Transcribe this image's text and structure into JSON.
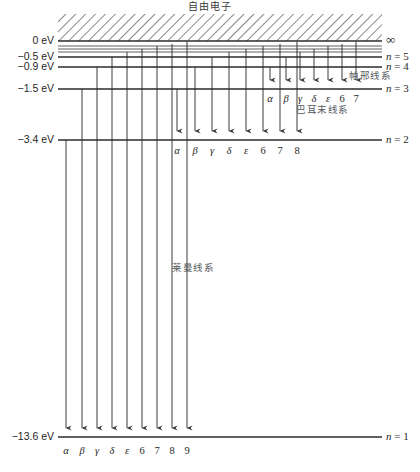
{
  "figure": {
    "top_title": "自由电子",
    "infinity_label": "∞",
    "background": "#ffffff",
    "line_color": "#2b2b2b",
    "arrow_color": "#3a3a3a",
    "annotation_color": "#555a5e"
  },
  "levels": [
    {
      "n": "",
      "energy_label": "0 eV",
      "right_label_prefix": "",
      "right_label": "",
      "y": 41,
      "is_continuum_edge": true
    },
    {
      "n": "5",
      "energy_label": "−0.5 eV",
      "right_label_prefix": "n",
      "right_label": "= 5",
      "y": 57,
      "is_continuum_edge": false
    },
    {
      "n": "4",
      "energy_label": "−0.9 eV",
      "right_label_prefix": "n",
      "right_label": "= 4",
      "y": 67,
      "is_continuum_edge": false
    },
    {
      "n": "3",
      "energy_label": "−1.5 eV",
      "right_label_prefix": "n",
      "right_label": "= 3",
      "y": 89,
      "is_continuum_edge": false
    },
    {
      "n": "2",
      "energy_label": "−3.4 eV",
      "right_label_prefix": "n",
      "right_label": "= 2",
      "y": 140,
      "is_continuum_edge": false
    },
    {
      "n": "1",
      "energy_label": "−13.6 eV",
      "right_label_prefix": "n",
      "right_label": "= 1",
      "y": 437,
      "is_continuum_edge": false
    }
  ],
  "extra_levels_y": [
    46,
    49,
    52
  ],
  "series": [
    {
      "key": "paschen",
      "name_cn": "帕邢线系",
      "name_x": 349,
      "name_y": 76,
      "target_y": 89,
      "label_y": 100,
      "lines": [
        {
          "label": "α",
          "kind": "greek",
          "x": 270,
          "from_y": 67
        },
        {
          "label": "β",
          "kind": "greek",
          "x": 286,
          "from_y": 57
        },
        {
          "label": "γ",
          "kind": "greek",
          "x": 300,
          "from_y": 52
        },
        {
          "label": "δ",
          "kind": "greek",
          "x": 314,
          "from_y": 49
        },
        {
          "label": "ε",
          "kind": "greek",
          "x": 328,
          "from_y": 46
        },
        {
          "label": "6",
          "kind": "num",
          "x": 342,
          "from_y": 44
        },
        {
          "label": "7",
          "kind": "num",
          "x": 356,
          "from_y": 42
        }
      ]
    },
    {
      "key": "balmer",
      "name_cn": "巴耳末线系",
      "name_x": 296,
      "name_y": 110,
      "target_y": 140,
      "label_y": 152,
      "lines": [
        {
          "label": "α",
          "kind": "greek",
          "x": 177,
          "from_y": 89
        },
        {
          "label": "β",
          "kind": "greek",
          "x": 195,
          "from_y": 67
        },
        {
          "label": "γ",
          "kind": "greek",
          "x": 212,
          "from_y": 57
        },
        {
          "label": "δ",
          "kind": "greek",
          "x": 229,
          "from_y": 52
        },
        {
          "label": "ε",
          "kind": "greek",
          "x": 246,
          "from_y": 49
        },
        {
          "label": "6",
          "kind": "num",
          "x": 263,
          "from_y": 46
        },
        {
          "label": "7",
          "kind": "num",
          "x": 280,
          "from_y": 44
        },
        {
          "label": "8",
          "kind": "num",
          "x": 297,
          "from_y": 42
        }
      ]
    },
    {
      "key": "lyman",
      "name_cn": "莱曼线系",
      "name_x": 172,
      "name_y": 268,
      "target_y": 437,
      "label_y": 452,
      "lines": [
        {
          "label": "α",
          "kind": "greek",
          "x": 66,
          "from_y": 140
        },
        {
          "label": "β",
          "kind": "greek",
          "x": 82,
          "from_y": 89
        },
        {
          "label": "γ",
          "kind": "greek",
          "x": 97,
          "from_y": 67
        },
        {
          "label": "δ",
          "kind": "greek",
          "x": 112,
          "from_y": 57
        },
        {
          "label": "ε",
          "kind": "greek",
          "x": 127,
          "from_y": 52
        },
        {
          "label": "6",
          "kind": "num",
          "x": 142,
          "from_y": 49
        },
        {
          "label": "7",
          "kind": "num",
          "x": 157,
          "from_y": 46
        },
        {
          "label": "8",
          "kind": "num",
          "x": 172,
          "from_y": 44
        },
        {
          "label": "9",
          "kind": "num",
          "x": 187,
          "from_y": 42
        }
      ]
    }
  ],
  "geometry": {
    "left_line_x": 58,
    "right_line_x": 382,
    "label_x": 54,
    "right_label_x": 386,
    "continuum_top_y": 14,
    "continuum_bottom_y": 41
  }
}
